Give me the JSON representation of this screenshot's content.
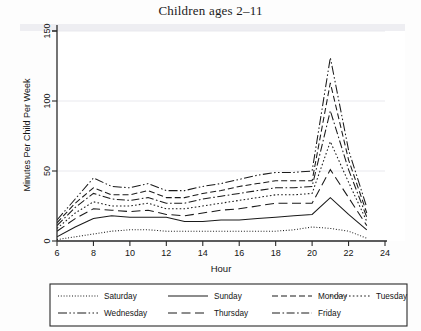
{
  "chart_data": {
    "type": "line",
    "title": "Children ages 2–11",
    "xlabel": "Hour",
    "ylabel": "Minutes Per Child Per Week",
    "xlim": [
      6,
      24
    ],
    "ylim": [
      0,
      150
    ],
    "xticks": [
      6,
      8,
      10,
      12,
      14,
      16,
      18,
      20,
      22,
      24
    ],
    "yticks": [
      0,
      50,
      100,
      150
    ],
    "grid": "horizontal",
    "legend_position": "below-plot",
    "x": [
      6,
      7,
      8,
      9,
      10,
      11,
      12,
      13,
      14,
      15,
      16,
      17,
      18,
      19,
      20,
      21,
      22,
      23
    ],
    "series": [
      {
        "name": "Saturday",
        "dash": "fine-dotted",
        "values": [
          1,
          3,
          5,
          7,
          8,
          8,
          7,
          7,
          7,
          7,
          7,
          7,
          7,
          8,
          10,
          9,
          7,
          2
        ]
      },
      {
        "name": "Sunday",
        "dash": "solid",
        "values": [
          3,
          10,
          16,
          18,
          17,
          17,
          17,
          14,
          14,
          15,
          15,
          16,
          17,
          18,
          19,
          31,
          19,
          8
        ]
      },
      {
        "name": "Monday",
        "dash": "dashed",
        "values": [
          13,
          27,
          38,
          33,
          33,
          36,
          31,
          31,
          34,
          36,
          39,
          41,
          43,
          43,
          43,
          113,
          58,
          20
        ]
      },
      {
        "name": "Tuesday",
        "dash": "dotted",
        "values": [
          9,
          20,
          28,
          25,
          25,
          27,
          23,
          23,
          25,
          27,
          29,
          31,
          33,
          33,
          34,
          71,
          42,
          14
        ]
      },
      {
        "name": "Wednesday",
        "dash": "dash-dot-dot",
        "values": [
          15,
          30,
          45,
          39,
          38,
          41,
          36,
          36,
          39,
          41,
          44,
          47,
          49,
          49,
          50,
          131,
          65,
          24
        ]
      },
      {
        "name": "Thursday",
        "dash": "long-dash",
        "values": [
          7,
          16,
          23,
          22,
          21,
          22,
          19,
          18,
          20,
          22,
          23,
          25,
          27,
          27,
          27,
          51,
          31,
          11
        ]
      },
      {
        "name": "Friday",
        "dash": "dash-dot",
        "values": [
          11,
          24,
          34,
          30,
          29,
          31,
          27,
          27,
          30,
          32,
          34,
          36,
          38,
          38,
          39,
          93,
          51,
          17
        ]
      }
    ],
    "legend_rows": [
      [
        "Saturday",
        "Sunday",
        "Monday",
        "Tuesday"
      ],
      [
        "Wednesday",
        "Thursday",
        "Friday"
      ]
    ]
  }
}
